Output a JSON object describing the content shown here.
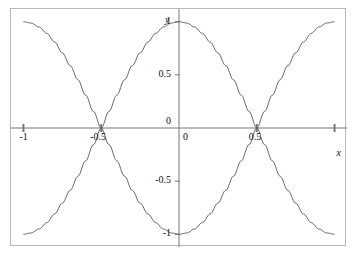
{
  "chart_data": {
    "type": "line",
    "title": "",
    "subtitle": "",
    "xlabel": "x",
    "ylabel": "y",
    "xlim": [
      -1.08,
      1.08
    ],
    "ylim": [
      -1.12,
      1.12
    ],
    "grid": false,
    "legend": "none",
    "x_ticks": [
      {
        "value": -1,
        "label": "-1"
      },
      {
        "value": -0.5,
        "label": "-0.5"
      },
      {
        "value": 0,
        "label": "0"
      },
      {
        "value": 0.5,
        "label": "0.5"
      },
      {
        "value": 1,
        "label": ""
      }
    ],
    "y_ticks": [
      {
        "value": 1,
        "label": "1"
      },
      {
        "value": 0.5,
        "label": "0.5"
      },
      {
        "value": 0,
        "label": "0"
      },
      {
        "value": -0.5,
        "label": "-0.5"
      },
      {
        "value": -1,
        "label": "-1"
      }
    ],
    "series": [
      {
        "name": "cos(pi*x)",
        "color": "#555555",
        "expression": "y = cos(pi*x)",
        "x": [
          -1,
          -0.95,
          -0.9,
          -0.85,
          -0.8,
          -0.75,
          -0.7,
          -0.65,
          -0.6,
          -0.55,
          -0.5,
          -0.45,
          -0.4,
          -0.35,
          -0.3,
          -0.25,
          -0.2,
          -0.15,
          -0.1,
          -0.05,
          0,
          0.05,
          0.1,
          0.15,
          0.2,
          0.25,
          0.3,
          0.35,
          0.4,
          0.45,
          0.5,
          0.55,
          0.6,
          0.65,
          0.7,
          0.75,
          0.8,
          0.85,
          0.9,
          0.95,
          1
        ],
        "values": [
          -1,
          -0.988,
          -0.951,
          -0.891,
          -0.809,
          -0.707,
          -0.588,
          -0.454,
          -0.309,
          -0.156,
          0,
          0.156,
          0.309,
          0.454,
          0.588,
          0.707,
          0.809,
          0.891,
          0.951,
          0.988,
          1,
          0.988,
          0.951,
          0.891,
          0.809,
          0.707,
          0.588,
          0.454,
          0.309,
          0.156,
          0,
          -0.156,
          -0.309,
          -0.454,
          -0.588,
          -0.707,
          -0.809,
          -0.891,
          -0.951,
          -0.988,
          -1
        ]
      },
      {
        "name": "-cos(pi*x)",
        "color": "#555555",
        "expression": "y = -cos(pi*x)",
        "x": [
          -1,
          -0.95,
          -0.9,
          -0.85,
          -0.8,
          -0.75,
          -0.7,
          -0.65,
          -0.6,
          -0.55,
          -0.5,
          -0.45,
          -0.4,
          -0.35,
          -0.3,
          -0.25,
          -0.2,
          -0.15,
          -0.1,
          -0.05,
          0,
          0.05,
          0.1,
          0.15,
          0.2,
          0.25,
          0.3,
          0.35,
          0.4,
          0.45,
          0.5,
          0.55,
          0.6,
          0.65,
          0.7,
          0.75,
          0.8,
          0.85,
          0.9,
          0.95,
          1
        ],
        "values": [
          1,
          0.988,
          0.951,
          0.891,
          0.809,
          0.707,
          0.588,
          0.454,
          0.309,
          0.156,
          0,
          -0.156,
          -0.309,
          -0.454,
          -0.588,
          -0.707,
          -0.809,
          -0.891,
          -0.951,
          -0.988,
          -1,
          -0.988,
          -0.951,
          -0.891,
          -0.809,
          -0.707,
          -0.588,
          -0.454,
          -0.309,
          -0.156,
          0,
          0.156,
          0.309,
          0.454,
          0.588,
          0.707,
          0.809,
          0.891,
          0.951,
          0.988,
          1
        ]
      }
    ],
    "intersections": [
      {
        "x": -1,
        "y": 0
      },
      {
        "x": -0.5,
        "y": 0
      },
      {
        "x": 0.5,
        "y": 0
      },
      {
        "x": 1,
        "y": 0
      }
    ],
    "axis_color": "#777777",
    "curve_color": "#555555",
    "frame_color": "#b9b9b9"
  },
  "labels": {
    "y_axis_name": "y",
    "x_axis_name": "x",
    "y_tick_1": "1",
    "y_tick_05": "0.5",
    "y_tick_0": "0",
    "y_tick_m05": "-0.5",
    "y_tick_m1": "-1",
    "x_tick_m1": "-1",
    "x_tick_m05": "-0.5",
    "x_tick_0": "0",
    "x_tick_05": "0.5"
  }
}
